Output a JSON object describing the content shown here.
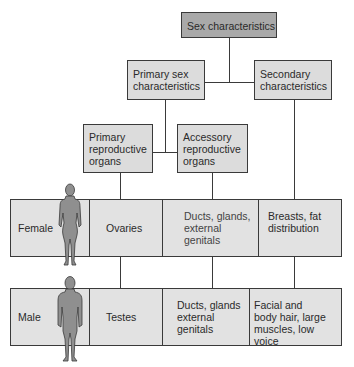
{
  "title_box": {
    "label": "Sex characteristics"
  },
  "level2": {
    "primary_sex": {
      "label": "Primary sex\ncharacteristics"
    },
    "secondary": {
      "label": "Secondary\ncharacteristics"
    }
  },
  "level3": {
    "primary_repro": {
      "label": "Primary\nreproductive\norgans"
    },
    "accessory_repro": {
      "label": "Accessory\nreproductive\norgans"
    }
  },
  "rows": [
    {
      "sex": "Female",
      "icon": "female-figure-icon",
      "primary": "Ovaries",
      "accessory": "Ducts, glands,\nexternal\ngenitals",
      "secondary": "Breasts, fat\ndistribution"
    },
    {
      "sex": "Male",
      "icon": "male-figure-icon",
      "primary": "Testes",
      "accessory": "Ducts, glands\nexternal\ngenitals",
      "secondary": "Facial and\nbody hair, large\nmuscles, low voice"
    }
  ],
  "colors": {
    "top_box": "#a9a9a9",
    "box": "#dcdcdc",
    "row": "#e2e2e2",
    "figure": "#8f8f8f",
    "line": "#3a3a3a"
  }
}
